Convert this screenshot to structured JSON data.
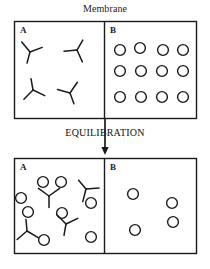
{
  "figure": {
    "title_label": "Membrane",
    "process_label": "EQUILIBRATION",
    "stroke_color": "#1a1a1a",
    "background_color": "#ffffff"
  },
  "panels": [
    {
      "id": "before",
      "compartments": [
        {
          "id": "before-A",
          "label": "A",
          "molecule_count": 4,
          "solute_count": 0,
          "molecules": [
            {
              "x": 30,
              "y": 52,
              "rot": 15
            },
            {
              "x": 77,
              "y": 50,
              "rot": -150
            },
            {
              "x": 33,
              "y": 90,
              "rot": 170
            },
            {
              "x": 70,
              "y": 93,
              "rot": -20
            }
          ],
          "solutes": []
        },
        {
          "id": "before-B",
          "label": "B",
          "molecule_count": 0,
          "solute_count": 12,
          "molecules": [],
          "solutes": [
            {
              "x": 120,
              "y": 50
            },
            {
              "x": 140,
              "y": 48
            },
            {
              "x": 163,
              "y": 50
            },
            {
              "x": 183,
              "y": 50
            },
            {
              "x": 120,
              "y": 71
            },
            {
              "x": 141,
              "y": 71
            },
            {
              "x": 162,
              "y": 71
            },
            {
              "x": 183,
              "y": 71
            },
            {
              "x": 120,
              "y": 97
            },
            {
              "x": 141,
              "y": 97
            },
            {
              "x": 162,
              "y": 97
            },
            {
              "x": 183,
              "y": 97
            }
          ]
        }
      ]
    },
    {
      "id": "after",
      "compartments": [
        {
          "id": "after-A",
          "label": "A",
          "molecule_count": 4,
          "solute_count": 8,
          "molecules": [
            {
              "x": 49,
              "y": 196,
              "rot": 0
            },
            {
              "x": 86,
              "y": 189,
              "rot": 140
            },
            {
              "x": 66,
              "y": 224,
              "rot": 10
            },
            {
              "x": 27,
              "y": 231,
              "rot": 175
            }
          ],
          "solutes": [
            {
              "x": 21,
              "y": 198
            },
            {
              "x": 43,
              "y": 182
            },
            {
              "x": 61,
              "y": 182
            },
            {
              "x": 28,
              "y": 212
            },
            {
              "x": 91,
              "y": 203
            },
            {
              "x": 62,
              "y": 213
            },
            {
              "x": 44,
              "y": 240
            },
            {
              "x": 91,
              "y": 237
            }
          ]
        },
        {
          "id": "after-B",
          "label": "B",
          "molecule_count": 0,
          "solute_count": 4,
          "molecules": [],
          "solutes": [
            {
              "x": 133,
              "y": 194
            },
            {
              "x": 172,
              "y": 203
            },
            {
              "x": 135,
              "y": 230
            },
            {
              "x": 173,
              "y": 222
            }
          ]
        }
      ]
    }
  ],
  "geometry": {
    "box_top": {
      "x": 14,
      "y": 21,
      "w": 182,
      "h": 97,
      "divider_x": 104
    },
    "box_bottom": {
      "x": 14,
      "y": 158,
      "w": 182,
      "h": 95,
      "divider_x": 104
    },
    "arrow": {
      "x": 105,
      "y_start": 119,
      "y_end": 155
    }
  }
}
